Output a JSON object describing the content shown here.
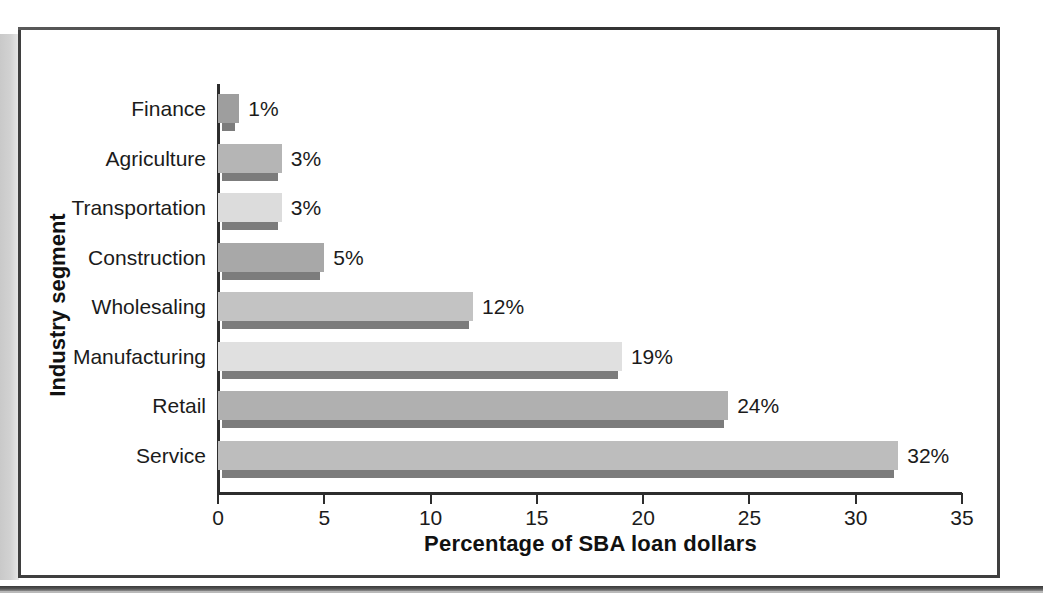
{
  "figure": {
    "frame": {
      "border_color": "#3f3f3f"
    },
    "gutter_color": "#cfcfcf"
  },
  "chart_data": {
    "type": "bar",
    "orientation": "horizontal",
    "title": "",
    "xlabel": "Percentage of SBA loan dollars",
    "ylabel": "Industry segment",
    "categories": [
      "Finance",
      "Agriculture",
      "Transportation",
      "Construction",
      "Wholesaling",
      "Manufacturing",
      "Retail",
      "Service"
    ],
    "values": [
      1,
      3,
      3,
      5,
      12,
      19,
      24,
      32
    ],
    "value_labels": [
      "1%",
      "3%",
      "3%",
      "5%",
      "12%",
      "19%",
      "24%",
      "32%"
    ],
    "xlim": [
      0,
      35
    ],
    "xticks": [
      0,
      5,
      10,
      15,
      20,
      25,
      30,
      35
    ],
    "xtick_labels": [
      "0",
      "5",
      "10",
      "15",
      "20",
      "25",
      "30",
      "35"
    ],
    "grid": false,
    "legend": "none",
    "bar_colors": [
      "#9e9e9e",
      "#b5b5b5",
      "#dcdcdc",
      "#a8a8a8",
      "#c3c3c3",
      "#e0e0e0",
      "#b0b0b0",
      "#bdbdbd"
    ],
    "shadow_color": "#7c7c7c"
  }
}
